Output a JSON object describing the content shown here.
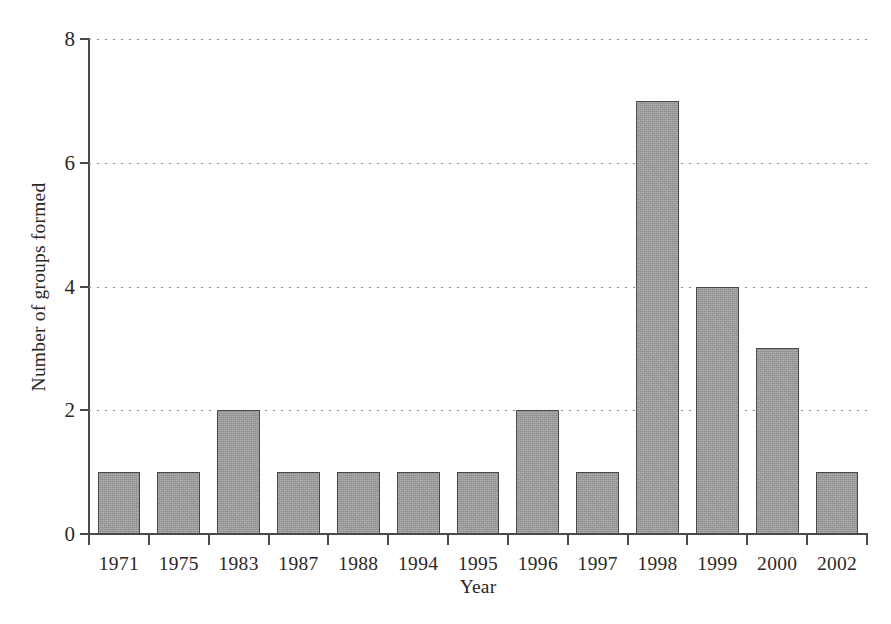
{
  "chart_data": {
    "type": "bar",
    "title": "",
    "xlabel": "Year",
    "ylabel": "Number of groups formed",
    "categories": [
      "1971",
      "1975",
      "1983",
      "1987",
      "1988",
      "1994",
      "1995",
      "1996",
      "1997",
      "1998",
      "1999",
      "2000",
      "2002"
    ],
    "values": [
      1,
      1,
      2,
      1,
      1,
      1,
      1,
      2,
      1,
      7,
      4,
      3,
      1
    ],
    "ylim": [
      0,
      8
    ],
    "y_ticks": [
      0,
      2,
      4,
      6,
      8
    ],
    "y_tick_labels": [
      "0",
      "2",
      "4",
      "6",
      "8"
    ],
    "grid": "horizontal-dotted",
    "legend": "none",
    "bar_fill_color": "#9b9b9b",
    "bar_border_color": "#4a4846",
    "axis_color": "#4c4a48",
    "gridline_color": "#8d8b89",
    "background_color": "#ffffff"
  }
}
